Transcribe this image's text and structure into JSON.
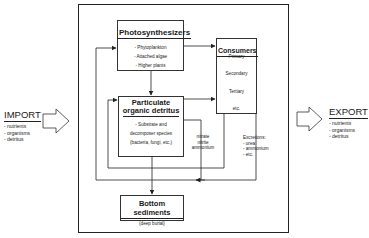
{
  "diagram": {
    "import": {
      "title": "IMPORT",
      "items": [
        "- nutrients",
        "- organisms",
        "- detritus"
      ]
    },
    "export": {
      "title": "EXPORT",
      "items": [
        "- nutrients",
        "- organisms",
        "- detritus"
      ]
    },
    "boxes": {
      "photosynthesizers": {
        "title": "Photosynthesizers",
        "items": [
          "- Phytoplankton",
          "- Attached algae",
          "- Higher plants"
        ]
      },
      "consumers": {
        "title": "Consumers",
        "levels": [
          "Primary",
          "Secondary",
          "Tertiary",
          "etc."
        ]
      },
      "detritus": {
        "title_line1": "Particulate",
        "title_line2": "organic detritus",
        "items": [
          "- Substrate and",
          "decomposer species",
          "(bacteria, fungi, etc.)"
        ]
      },
      "sediments": {
        "title": "Bottom sediments",
        "subtitle": "(deep burial)"
      }
    },
    "annotations": {
      "nutrients": [
        "nitrate",
        "nitrite",
        "ammonium"
      ],
      "excretions": [
        "Excretions:",
        "- urea",
        "- ammonium",
        "- etc."
      ]
    },
    "edges": [
      {
        "from": "photosynthesizers",
        "to": "consumers"
      },
      {
        "from": "photosynthesizers",
        "to": "detritus"
      },
      {
        "from": "detritus",
        "to": "consumers"
      },
      {
        "from": "detritus",
        "to": "sediments"
      },
      {
        "from": "consumers",
        "to": "detritus",
        "label": "return loop"
      },
      {
        "from": "consumers",
        "to": "photosynthesizers",
        "label": "excretions: urea, ammonium, etc."
      },
      {
        "from": "detritus",
        "to": "photosynthesizers",
        "label": "nitrate, nitrite, ammonium"
      },
      {
        "from": "import",
        "to": "system"
      },
      {
        "from": "system",
        "to": "export"
      }
    ],
    "colors": {
      "line": "#222222",
      "background": "#ffffff"
    }
  }
}
